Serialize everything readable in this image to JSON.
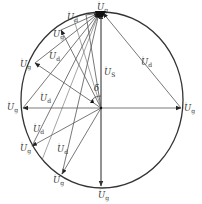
{
  "figure": {
    "labels": {
      "ug_top": "U",
      "ug_top_sub": "g",
      "ud_topleft": "U",
      "ud_topleft_sub": "d",
      "ug_upper_left": "U",
      "ug_upper_left_sub": "g",
      "ud_upper_left": "U",
      "ud_upper_left_sub": "d",
      "ug_left_upper": "U",
      "ug_left_upper_sub": "g",
      "us_center": "U",
      "us_center_sub": "S",
      "ud_topright": "U",
      "ud_topright_sub": "d",
      "delta": "δ",
      "ug_left": "U",
      "ug_left_sub": "g",
      "ud_left": "U",
      "ud_left_sub": "d",
      "ug_right": "U",
      "ug_right_sub": "g",
      "ud_lower_left": "U",
      "ud_lower_left_sub": "d",
      "ug_lower_left": "U",
      "ug_lower_left_sub": "g",
      "ud_lower_mid": "U",
      "ud_lower_mid_sub": "d",
      "ug_lower_mid": "U",
      "ug_lower_mid_sub": "g",
      "ug_bottom": "U",
      "ug_bottom_sub": "g"
    },
    "colors": {
      "line": "#555555",
      "circle": "#333333",
      "text": "#333333"
    }
  }
}
